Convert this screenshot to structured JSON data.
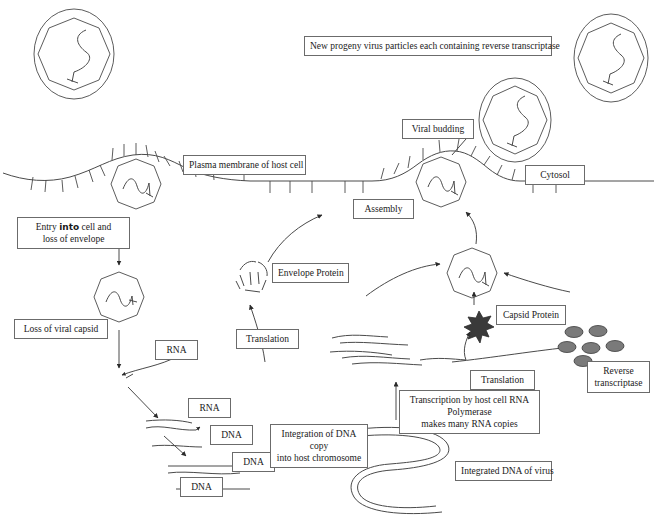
{
  "diagram": {
    "background": "#ffffff",
    "stroke": "#4a4a4a",
    "text_color": "#1a1a1a",
    "protein_fill": "#7a7a7a",
    "capsid_protein_fill": "#3a3a3a",
    "width": 657,
    "height": 519
  },
  "labels": {
    "new_progeny": "New progeny virus particles each containing reverse transcriptase",
    "viral_budding": "Viral budding",
    "plasma_membrane": "Plasma membrane of host cell",
    "cytosol": "Cytosol",
    "assembly": "Assembly",
    "entry_line1_a": "Entry ",
    "entry_line1_b": "into",
    "entry_line1_c": " cell and",
    "entry_line2": "loss of envelope",
    "loss_of_capsid": "Loss of viral capsid",
    "rna_1": "RNA",
    "rna_2": "RNA",
    "dna_1": "DNA",
    "dna_2": "DNA",
    "dna_3": "DNA",
    "integration_line1": "Integration of DNA copy",
    "integration_line2": "into host chromosome",
    "integrated_dna": "Integrated DNA of virus",
    "transcription_line1": "Transcription by host cell RNA Polymerase",
    "transcription_line2": "makes many RNA copies",
    "translation_left": "Translation",
    "translation_right": "Translation",
    "envelope_protein": "Envelope Protein",
    "capsid_protein": "Capsid Protein",
    "reverse_transcriptase_line1": "Reverse",
    "reverse_transcriptase_line2": "transcriptase"
  }
}
